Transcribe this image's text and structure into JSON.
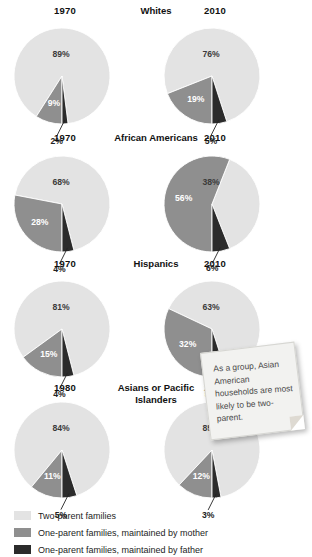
{
  "legend": {
    "items": [
      {
        "label": "Two-parent families",
        "color": "#e3e3e3",
        "key": "two_parent"
      },
      {
        "label": "One-parent families, maintained by mother",
        "color": "#8f8f8f",
        "key": "mother"
      },
      {
        "label": "One-parent families, maintained by father",
        "color": "#2b2b2b",
        "key": "father"
      }
    ]
  },
  "callout": {
    "text": "As a group, Asian American households are most likely to be two-parent."
  },
  "chart_data": {
    "type": "pie",
    "title": "",
    "legend_position": "bottom",
    "series_names": [
      "Two-parent families",
      "One-parent families, maintained by mother",
      "One-parent families, maintained by father"
    ],
    "colors": [
      "#e3e3e3",
      "#8f8f8f",
      "#2b2b2b"
    ],
    "groups": [
      {
        "name": "Whites",
        "charts": [
          {
            "year": "1970",
            "values": [
              89,
              9,
              2
            ],
            "labels": [
              "89%",
              "9%",
              "2%"
            ],
            "outside": [
              false,
              false,
              true
            ]
          },
          {
            "year": "2010",
            "values": [
              76,
              19,
              5
            ],
            "labels": [
              "76%",
              "19%",
              "5%"
            ],
            "outside": [
              false,
              false,
              true
            ]
          }
        ]
      },
      {
        "name": "African Americans",
        "charts": [
          {
            "year": "1970",
            "values": [
              68,
              28,
              4
            ],
            "labels": [
              "68%",
              "28%",
              "4%"
            ],
            "outside": [
              false,
              false,
              true
            ]
          },
          {
            "year": "2010",
            "values": [
              38,
              56,
              6
            ],
            "labels": [
              "38%",
              "56%",
              "6%"
            ],
            "outside": [
              false,
              false,
              true
            ]
          }
        ]
      },
      {
        "name": "Hispanics",
        "charts": [
          {
            "year": "1970",
            "values": [
              81,
              15,
              4
            ],
            "labels": [
              "81%",
              "15%",
              "4%"
            ],
            "outside": [
              false,
              false,
              true
            ]
          },
          {
            "year": "2010",
            "values": [
              63,
              32,
              5
            ],
            "labels": [
              "63%",
              "32%",
              "5%"
            ],
            "outside": [
              false,
              false,
              true
            ]
          }
        ]
      },
      {
        "name": "Asians or Pacific Islanders",
        "charts": [
          {
            "year": "1980",
            "values": [
              84,
              11,
              5
            ],
            "labels": [
              "84%",
              "11%",
              "5%"
            ],
            "outside": [
              false,
              false,
              true
            ]
          },
          {
            "year": "2010",
            "values": [
              85,
              12,
              3
            ],
            "labels": [
              "85%",
              "12%",
              "3%"
            ],
            "outside": [
              false,
              false,
              true
            ]
          }
        ]
      }
    ]
  }
}
